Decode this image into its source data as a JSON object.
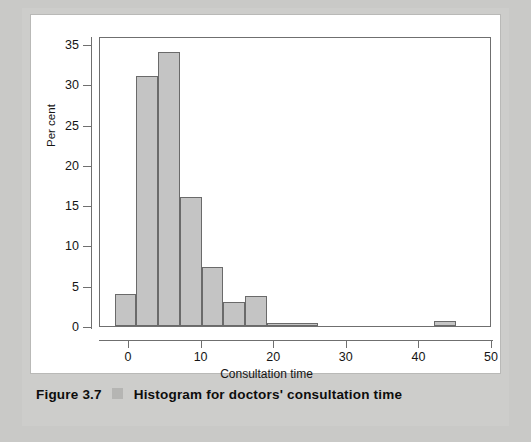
{
  "caption": {
    "label": "Figure 3.7",
    "text": "Histogram for doctors' consultation time",
    "swatch_icon": "square-swatch-icon",
    "swatch_color": "#b5b5b3"
  },
  "colors": {
    "page_background": "#c9c9c7",
    "card_background": "#ffffff",
    "bar_fill": "#c4c4c4",
    "bar_stroke": "#6a6a6a",
    "axis": "#6f6f6f",
    "text": "#151515"
  },
  "chart_data": {
    "type": "bar",
    "title": "",
    "subtitle": "",
    "xlabel": "Consultation time",
    "ylabel": "Per cent",
    "xlim": [
      -4,
      50
    ],
    "ylim": [
      0,
      36
    ],
    "xticks": [
      0,
      10,
      20,
      30,
      40,
      50
    ],
    "yticks": [
      0,
      5,
      10,
      15,
      20,
      25,
      30,
      35
    ],
    "xtick_labels": [
      "0",
      "10",
      "20",
      "30",
      "40",
      "50"
    ],
    "ytick_labels": [
      "0",
      "5",
      "10",
      "15",
      "20",
      "25",
      "30",
      "35"
    ],
    "grid": false,
    "legend": false,
    "bin_width": 3,
    "bins": [
      {
        "start": -2,
        "end": 1,
        "center": -0.5,
        "value": 4.0
      },
      {
        "start": 1,
        "end": 4,
        "center": 2.5,
        "value": 31.0
      },
      {
        "start": 4,
        "end": 7,
        "center": 5.5,
        "value": 34.0
      },
      {
        "start": 7,
        "end": 10,
        "center": 8.5,
        "value": 16.0
      },
      {
        "start": 10,
        "end": 13,
        "center": 11.5,
        "value": 7.3
      },
      {
        "start": 13,
        "end": 16,
        "center": 14.5,
        "value": 3.0
      },
      {
        "start": 16,
        "end": 19,
        "center": 17.5,
        "value": 3.7
      },
      {
        "start": 19,
        "end": 26,
        "center": 22.5,
        "value": 0.4
      },
      {
        "start": 42,
        "end": 45,
        "center": 43.5,
        "value": 0.6
      }
    ],
    "categories": [
      "-0.5",
      "2.5",
      "5.5",
      "8.5",
      "11.5",
      "14.5",
      "17.5",
      "22.5",
      "43.5"
    ],
    "values": [
      4.0,
      31.0,
      34.0,
      16.0,
      7.3,
      3.0,
      3.7,
      0.4,
      0.6
    ]
  }
}
